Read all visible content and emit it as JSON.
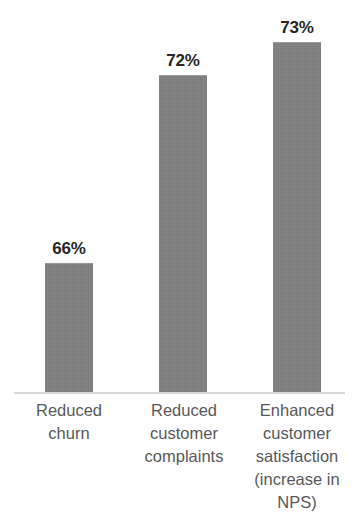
{
  "chart_data": {
    "type": "bar",
    "title": "",
    "subtitle": "",
    "xlabel": "",
    "ylabel": "",
    "grid": false,
    "legend": null,
    "axis_line_color": "#D9D9D9",
    "bar_color": "#808080",
    "data_label_color": "#262626",
    "category_label_color": "#595959",
    "background": "#FFFFFF",
    "value_suffix": "%",
    "categories": [
      "Reduced churn",
      "Reduced customer complaints",
      "Enhanced customer satisfaction (increase in NPS)"
    ],
    "values": [
      66,
      72,
      73
    ],
    "data_labels": [
      "66%",
      "72%",
      "73%"
    ],
    "ylim": [
      0,
      75
    ],
    "note": "Rendered bar heights are not linearly proportional to the values; pixel geometry captured in bar_geometry.",
    "bar_geometry": [
      {
        "label": "66%",
        "left": 45,
        "width": 48,
        "top": 263,
        "height": 130
      },
      {
        "label": "72%",
        "left": 159,
        "width": 48,
        "top": 75,
        "height": 318
      },
      {
        "label": "73%",
        "left": 273,
        "width": 48,
        "top": 42,
        "height": 351
      }
    ],
    "category_label_boxes": [
      {
        "left": 14,
        "width": 110
      },
      {
        "left": 128,
        "width": 112
      },
      {
        "left": 240,
        "width": 114
      }
    ]
  }
}
